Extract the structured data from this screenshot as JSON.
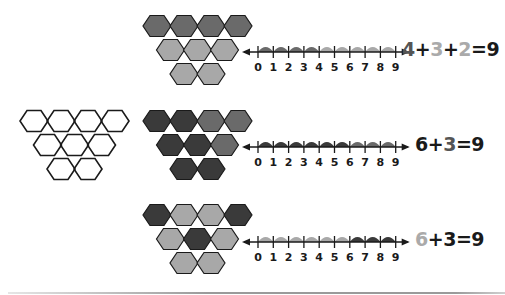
{
  "colors": {
    "dark": "#3a3a3a",
    "medium": "#6a6a6a",
    "light": "#a8a8a8",
    "outline": "#1a1a1a",
    "white": "#ffffff",
    "text_dark": "#1a1a1a",
    "text_medium": "#555555",
    "text_light": "#aaaaaa"
  },
  "number_line_ticks": [
    "0",
    "1",
    "2",
    "3",
    "4",
    "5",
    "6",
    "7",
    "8",
    "9"
  ],
  "rows": [
    {
      "id": "row-1",
      "hex_colors": [
        "medium",
        "medium",
        "medium",
        "medium",
        "light",
        "light",
        "light",
        "light",
        "light"
      ],
      "arc_colors": [
        "medium",
        "medium",
        "medium",
        "medium",
        "light",
        "light",
        "light",
        "light",
        "light"
      ],
      "equation": [
        {
          "text": "4",
          "color": "text_medium"
        },
        {
          "text": "+",
          "color": "text_dark"
        },
        {
          "text": "3",
          "color": "text_light"
        },
        {
          "text": "+",
          "color": "text_dark"
        },
        {
          "text": "2",
          "color": "text_light"
        },
        {
          "text": "=9",
          "color": "text_dark"
        }
      ]
    },
    {
      "id": "row-2",
      "has_outline_shape": true,
      "hex_colors": [
        "dark",
        "dark",
        "medium",
        "medium",
        "dark",
        "dark",
        "medium",
        "dark",
        "dark"
      ],
      "arc_colors": [
        "dark",
        "dark",
        "dark",
        "dark",
        "dark",
        "dark",
        "medium",
        "medium",
        "medium"
      ],
      "equation": [
        {
          "text": "6",
          "color": "text_dark"
        },
        {
          "text": "+",
          "color": "text_dark"
        },
        {
          "text": "3",
          "color": "text_medium"
        },
        {
          "text": "=9",
          "color": "text_dark"
        }
      ]
    },
    {
      "id": "row-3",
      "hex_colors": [
        "dark",
        "light",
        "light",
        "dark",
        "light",
        "dark",
        "light",
        "light",
        "light"
      ],
      "arc_colors": [
        "light",
        "light",
        "light",
        "light",
        "light",
        "light",
        "dark",
        "dark",
        "dark"
      ],
      "equation": [
        {
          "text": "6",
          "color": "text_light"
        },
        {
          "text": "+",
          "color": "text_dark"
        },
        {
          "text": "3",
          "color": "text_dark"
        },
        {
          "text": "=9",
          "color": "text_dark"
        }
      ]
    }
  ]
}
